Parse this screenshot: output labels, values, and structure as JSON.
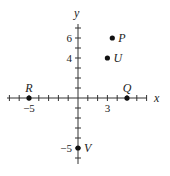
{
  "diagram": {
    "type": "coordinate-plane",
    "axes": {
      "x_label": "x",
      "y_label": "y",
      "x_range": [
        -7,
        7
      ],
      "y_range": [
        -6,
        7
      ],
      "tick_step": 1,
      "x_tick_labels": [
        {
          "value": -5,
          "text": "−5"
        },
        {
          "value": 3,
          "text": "3"
        }
      ],
      "y_tick_labels": [
        {
          "value": 6,
          "text": "6"
        },
        {
          "value": 4,
          "text": "4"
        },
        {
          "value": -5,
          "text": "−5"
        }
      ]
    },
    "points": [
      {
        "name": "P",
        "x": 3.5,
        "y": 6
      },
      {
        "name": "U",
        "x": 3,
        "y": 4
      },
      {
        "name": "R",
        "x": -5,
        "y": 0
      },
      {
        "name": "Q",
        "x": 5,
        "y": 0
      },
      {
        "name": "V",
        "x": 0,
        "y": -5
      }
    ],
    "colors": {
      "ink": "#222222",
      "background": "#ffffff"
    }
  }
}
